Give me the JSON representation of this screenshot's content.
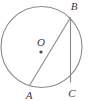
{
  "figure": {
    "type": "circle-geometry-diagram",
    "canvas": {
      "width": 88,
      "height": 101
    },
    "colors": {
      "background": "#ffffff",
      "stroke": "#8a8a8a",
      "label": "#3a3a3a",
      "center_dot": "#4a4a4a"
    },
    "stroke_width": 1.1,
    "circle": {
      "name": "main-circle",
      "cx": 41.5,
      "cy": 47,
      "r": 40.5
    },
    "center": {
      "name": "center-point-o",
      "label": "O",
      "dot_x": 41,
      "dot_y": 52,
      "dot_r": 1.6,
      "label_x": 41,
      "label_y": 43
    },
    "points": [
      {
        "id": "A",
        "label": "A",
        "x": 29.5,
        "y": 85.5,
        "label_x": 29,
        "label_y": 96
      },
      {
        "id": "B",
        "label": "B",
        "x": 70.5,
        "y": 17.5,
        "label_x": 74,
        "label_y": 7
      },
      {
        "id": "C",
        "label": "C",
        "x": 70.5,
        "y": 82.5,
        "label_x": 72,
        "label_y": 94
      }
    ],
    "segments": [
      {
        "id": "AB",
        "name": "chord-a-b",
        "from": "A",
        "to": "B"
      },
      {
        "id": "BC",
        "name": "chord-b-c",
        "from": "B",
        "to": "C"
      }
    ]
  }
}
